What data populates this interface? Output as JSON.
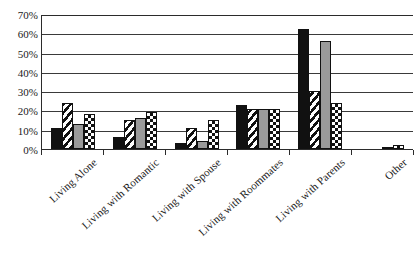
{
  "chart_data": {
    "type": "bar",
    "title": "",
    "xlabel": "",
    "ylabel": "",
    "ylim": [
      0,
      70
    ],
    "y_tick_labels": [
      "0%",
      "10%",
      "20%",
      "30%",
      "40%",
      "50%",
      "60%",
      "70%"
    ],
    "y_tick_values": [
      0,
      10,
      20,
      30,
      40,
      50,
      60,
      70
    ],
    "grid": true,
    "legend": "none",
    "categories": [
      "Living Alone",
      "Living with Romantic",
      "Living with Spouse",
      "Living with Roommates",
      "Living with Parents",
      "Other"
    ],
    "series": [
      {
        "name": "Series 1",
        "pattern": "solid-black",
        "color": "#111111",
        "values": [
          11,
          6,
          3,
          23,
          62,
          0
        ]
      },
      {
        "name": "Series 2",
        "pattern": "diagonal-stripe",
        "color": "#111111",
        "values": [
          24,
          15,
          11,
          21,
          30,
          0
        ]
      },
      {
        "name": "Series 3",
        "pattern": "solid-gray",
        "color": "#9a9a9a",
        "values": [
          13,
          16,
          4,
          21,
          56,
          1
        ]
      },
      {
        "name": "Series 4",
        "pattern": "checkerboard",
        "color": "#111111",
        "values": [
          18,
          19,
          15,
          21,
          24,
          2
        ]
      }
    ]
  },
  "axis": {
    "y_max_label": "70%",
    "y_min_label": "0%"
  }
}
